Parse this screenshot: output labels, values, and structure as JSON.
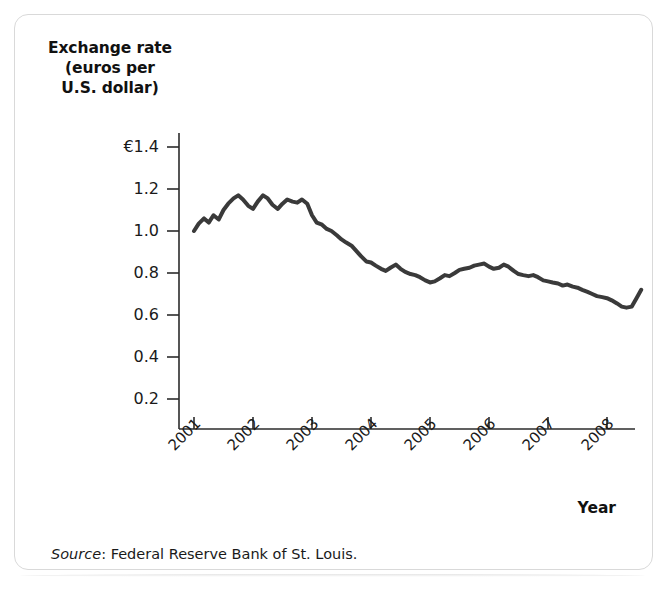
{
  "figure": {
    "source_prefix": "Source",
    "source_separator": ": ",
    "source_text": "Federal Reserve Bank of St. Louis."
  },
  "chart_data": {
    "type": "line",
    "title": "",
    "ylabel_lines": [
      "Exchange rate",
      "(euros per",
      "U.S. dollar)"
    ],
    "ylabel": "Exchange rate (euros per U.S. dollar)",
    "xlabel": "Year",
    "currency_symbol": "€",
    "ytick_labels": [
      "€1.4",
      "1.2",
      "1.0",
      "0.8",
      "0.6",
      "0.4",
      "0.2"
    ],
    "ytick_values": [
      1.4,
      1.2,
      1.0,
      0.8,
      0.6,
      0.4,
      0.2
    ],
    "ylim": [
      0.0,
      1.45
    ],
    "xtick_labels": [
      "2001",
      "2002",
      "2003",
      "2004",
      "2005",
      "2006",
      "2007",
      "2008"
    ],
    "xtick_values": [
      2001,
      2002,
      2003,
      2004,
      2005,
      2006,
      2007,
      2008
    ],
    "xlim": [
      2001.0,
      2008.6
    ],
    "grid": false,
    "legend": "none",
    "line_color": "#3a3a3a",
    "line_width": 4,
    "series": [
      {
        "name": "Euros per U.S. dollar",
        "x": [
          2001.0,
          2001.08,
          2001.17,
          2001.25,
          2001.33,
          2001.42,
          2001.5,
          2001.58,
          2001.67,
          2001.75,
          2001.83,
          2001.92,
          2002.0,
          2002.08,
          2002.17,
          2002.25,
          2002.33,
          2002.42,
          2002.5,
          2002.58,
          2002.67,
          2002.75,
          2002.83,
          2002.92,
          2003.0,
          2003.08,
          2003.17,
          2003.25,
          2003.33,
          2003.42,
          2003.5,
          2003.58,
          2003.67,
          2003.75,
          2003.83,
          2003.92,
          2004.0,
          2004.08,
          2004.17,
          2004.25,
          2004.33,
          2004.42,
          2004.5,
          2004.58,
          2004.67,
          2004.75,
          2004.83,
          2004.92,
          2005.0,
          2005.08,
          2005.17,
          2005.25,
          2005.33,
          2005.42,
          2005.5,
          2005.58,
          2005.67,
          2005.75,
          2005.83,
          2005.92,
          2006.0,
          2006.08,
          2006.17,
          2006.25,
          2006.33,
          2006.42,
          2006.5,
          2006.58,
          2006.67,
          2006.75,
          2006.83,
          2006.92,
          2007.0,
          2007.08,
          2007.17,
          2007.25,
          2007.33,
          2007.42,
          2007.5,
          2007.58,
          2007.67,
          2007.75,
          2007.83,
          2007.92,
          2008.0,
          2008.08,
          2008.17,
          2008.25,
          2008.33,
          2008.42,
          2008.5,
          2008.58
        ],
        "values": [
          1.0,
          1.035,
          1.06,
          1.04,
          1.075,
          1.055,
          1.1,
          1.13,
          1.155,
          1.17,
          1.15,
          1.12,
          1.105,
          1.14,
          1.17,
          1.155,
          1.125,
          1.105,
          1.13,
          1.15,
          1.14,
          1.135,
          1.15,
          1.13,
          1.075,
          1.04,
          1.03,
          1.01,
          1.0,
          0.98,
          0.96,
          0.945,
          0.93,
          0.905,
          0.88,
          0.855,
          0.85,
          0.835,
          0.82,
          0.81,
          0.825,
          0.84,
          0.82,
          0.805,
          0.795,
          0.79,
          0.78,
          0.765,
          0.755,
          0.76,
          0.775,
          0.79,
          0.785,
          0.8,
          0.815,
          0.82,
          0.825,
          0.835,
          0.84,
          0.845,
          0.83,
          0.82,
          0.825,
          0.84,
          0.83,
          0.81,
          0.795,
          0.79,
          0.785,
          0.79,
          0.78,
          0.765,
          0.76,
          0.755,
          0.75,
          0.74,
          0.745,
          0.735,
          0.73,
          0.72,
          0.71,
          0.7,
          0.69,
          0.685,
          0.68,
          0.67,
          0.655,
          0.64,
          0.635,
          0.64,
          0.68,
          0.72
        ]
      }
    ]
  }
}
